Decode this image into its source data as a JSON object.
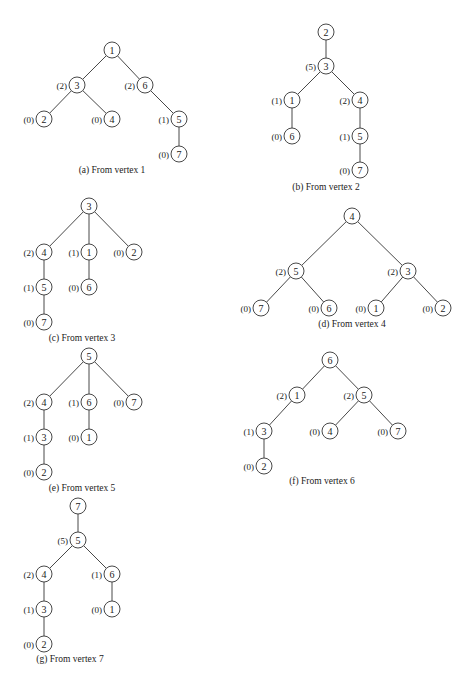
{
  "figure": {
    "node_radius": 8,
    "colors": {
      "stroke": "#333333",
      "text": "#222222",
      "background": "#ffffff"
    },
    "trees": [
      {
        "id": "a",
        "caption": "(a) From vertex 1",
        "caption_pos": [
          112,
          170
        ],
        "nodes": [
          {
            "id": "1",
            "x": 112,
            "y": 50,
            "height": null
          },
          {
            "id": "3",
            "x": 77,
            "y": 85,
            "height": "(2)"
          },
          {
            "id": "6",
            "x": 145,
            "y": 85,
            "height": "(2)"
          },
          {
            "id": "2",
            "x": 44,
            "y": 119,
            "height": "(0)"
          },
          {
            "id": "4",
            "x": 112,
            "y": 119,
            "height": "(0)"
          },
          {
            "id": "5",
            "x": 179,
            "y": 119,
            "height": "(1)"
          },
          {
            "id": "7",
            "x": 179,
            "y": 154,
            "height": "(0)"
          }
        ],
        "edges": [
          [
            "1",
            "3"
          ],
          [
            "1",
            "6"
          ],
          [
            "3",
            "2"
          ],
          [
            "3",
            "4"
          ],
          [
            "6",
            "5"
          ],
          [
            "5",
            "7"
          ]
        ]
      },
      {
        "id": "b",
        "caption": "(b) From vertex 2",
        "caption_pos": [
          326,
          187
        ],
        "nodes": [
          {
            "id": "2",
            "x": 326,
            "y": 32,
            "height": null
          },
          {
            "id": "3",
            "x": 326,
            "y": 66,
            "height": "(5)"
          },
          {
            "id": "1",
            "x": 292,
            "y": 100,
            "height": "(1)"
          },
          {
            "id": "4",
            "x": 360,
            "y": 100,
            "height": "(2)"
          },
          {
            "id": "6",
            "x": 292,
            "y": 136,
            "height": "(0)"
          },
          {
            "id": "5",
            "x": 360,
            "y": 136,
            "height": "(1)"
          },
          {
            "id": "7",
            "x": 360,
            "y": 170,
            "height": "(0)"
          }
        ],
        "edges": [
          [
            "2",
            "3"
          ],
          [
            "3",
            "1"
          ],
          [
            "3",
            "4"
          ],
          [
            "1",
            "6"
          ],
          [
            "4",
            "5"
          ],
          [
            "5",
            "7"
          ]
        ]
      },
      {
        "id": "c",
        "caption": "(c) From vertex 3",
        "caption_pos": [
          82,
          338
        ],
        "nodes": [
          {
            "id": "3",
            "x": 89,
            "y": 206,
            "height": null
          },
          {
            "id": "4",
            "x": 44,
            "y": 252,
            "height": "(2)"
          },
          {
            "id": "1",
            "x": 89,
            "y": 252,
            "height": "(1)"
          },
          {
            "id": "2",
            "x": 134,
            "y": 252,
            "height": "(0)"
          },
          {
            "id": "5",
            "x": 44,
            "y": 287,
            "height": "(1)"
          },
          {
            "id": "6",
            "x": 89,
            "y": 287,
            "height": "(0)"
          },
          {
            "id": "7",
            "x": 44,
            "y": 322,
            "height": "(0)"
          }
        ],
        "edges": [
          [
            "3",
            "4"
          ],
          [
            "3",
            "1"
          ],
          [
            "3",
            "2"
          ],
          [
            "4",
            "5"
          ],
          [
            "1",
            "6"
          ],
          [
            "5",
            "7"
          ]
        ]
      },
      {
        "id": "d",
        "caption": "(d) From vertex 4",
        "caption_pos": [
          352,
          324
        ],
        "nodes": [
          {
            "id": "4",
            "x": 352,
            "y": 216,
            "height": null
          },
          {
            "id": "5",
            "x": 296,
            "y": 271,
            "height": "(2)"
          },
          {
            "id": "3",
            "x": 408,
            "y": 271,
            "height": "(2)"
          },
          {
            "id": "7",
            "x": 261,
            "y": 308,
            "height": "(0)"
          },
          {
            "id": "6",
            "x": 329,
            "y": 308,
            "height": "(0)"
          },
          {
            "id": "1",
            "x": 376,
            "y": 308,
            "height": "(0)"
          },
          {
            "id": "2",
            "x": 443,
            "y": 308,
            "height": "(0)"
          }
        ],
        "edges": [
          [
            "4",
            "5"
          ],
          [
            "4",
            "3"
          ],
          [
            "5",
            "7"
          ],
          [
            "5",
            "6"
          ],
          [
            "3",
            "1"
          ],
          [
            "3",
            "2"
          ]
        ]
      },
      {
        "id": "e",
        "caption": "(e) From vertex 5",
        "caption_pos": [
          82,
          488
        ],
        "nodes": [
          {
            "id": "5",
            "x": 89,
            "y": 356,
            "height": null
          },
          {
            "id": "4",
            "x": 44,
            "y": 402,
            "height": "(2)"
          },
          {
            "id": "6",
            "x": 89,
            "y": 402,
            "height": "(1)"
          },
          {
            "id": "7",
            "x": 134,
            "y": 402,
            "height": "(0)"
          },
          {
            "id": "3",
            "x": 44,
            "y": 437,
            "height": "(1)"
          },
          {
            "id": "1",
            "x": 89,
            "y": 437,
            "height": "(0)"
          },
          {
            "id": "2",
            "x": 44,
            "y": 472,
            "height": "(0)"
          }
        ],
        "edges": [
          [
            "5",
            "4"
          ],
          [
            "5",
            "6"
          ],
          [
            "5",
            "7"
          ],
          [
            "4",
            "3"
          ],
          [
            "6",
            "1"
          ],
          [
            "3",
            "2"
          ]
        ]
      },
      {
        "id": "f",
        "caption": "(f) From vertex 6",
        "caption_pos": [
          322,
          481
        ],
        "nodes": [
          {
            "id": "6",
            "x": 330,
            "y": 360,
            "height": null
          },
          {
            "id": "1",
            "x": 297,
            "y": 395,
            "height": "(2)"
          },
          {
            "id": "5",
            "x": 364,
            "y": 395,
            "height": "(2)"
          },
          {
            "id": "3",
            "x": 264,
            "y": 431,
            "height": "(1)"
          },
          {
            "id": "4",
            "x": 330,
            "y": 431,
            "height": "(0)"
          },
          {
            "id": "7",
            "x": 398,
            "y": 431,
            "height": "(0)"
          },
          {
            "id": "2",
            "x": 264,
            "y": 466,
            "height": "(0)"
          }
        ],
        "edges": [
          [
            "6",
            "1"
          ],
          [
            "6",
            "5"
          ],
          [
            "1",
            "3"
          ],
          [
            "5",
            "4"
          ],
          [
            "5",
            "7"
          ],
          [
            "3",
            "2"
          ]
        ]
      },
      {
        "id": "g",
        "caption": "(g) From vertex 7",
        "caption_pos": [
          70,
          659
        ],
        "nodes": [
          {
            "id": "7",
            "x": 78,
            "y": 506,
            "height": null
          },
          {
            "id": "5",
            "x": 78,
            "y": 540,
            "height": "(5)"
          },
          {
            "id": "4",
            "x": 44,
            "y": 574,
            "height": "(2)"
          },
          {
            "id": "6",
            "x": 112,
            "y": 574,
            "height": "(1)"
          },
          {
            "id": "3",
            "x": 44,
            "y": 609,
            "height": "(1)"
          },
          {
            "id": "1",
            "x": 112,
            "y": 609,
            "height": "(0)"
          },
          {
            "id": "2",
            "x": 44,
            "y": 644,
            "height": "(0)"
          }
        ],
        "edges": [
          [
            "7",
            "5"
          ],
          [
            "5",
            "4"
          ],
          [
            "5",
            "6"
          ],
          [
            "4",
            "3"
          ],
          [
            "6",
            "1"
          ],
          [
            "3",
            "2"
          ]
        ]
      }
    ]
  }
}
